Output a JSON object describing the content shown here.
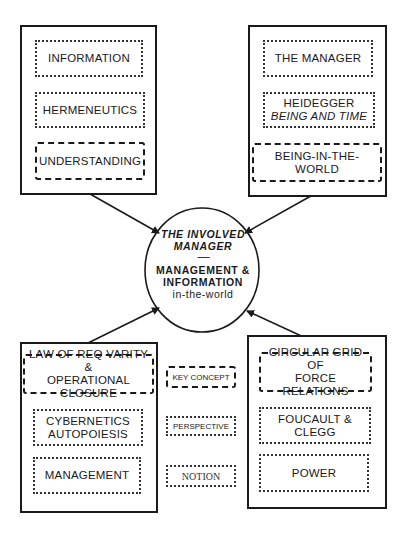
{
  "center": {
    "title_line1": "THE INVOLVED",
    "title_line2": "MANAGER",
    "separator": "-------",
    "line1": "MANAGEMENT &",
    "line2": "INFORMATION",
    "line3": "in-the-world"
  },
  "panels": {
    "top_left": {
      "notion": "INFORMATION",
      "perspective": "HERMENEUTICS",
      "key_concept": "UNDERSTANDING"
    },
    "top_right": {
      "notion": "THE MANAGER",
      "perspective_line1": "HEIDEGGER",
      "perspective_line2": "BEING AND TIME",
      "key_concept": "BEING-IN-THE-WORLD"
    },
    "bottom_left": {
      "key_concept_line1": "LAW OF REQ VARITY &",
      "key_concept_line2": "OPERATIONAL CLOSURE",
      "perspective_line1": "CYBERNETICS",
      "perspective_line2": "AUTOPOIESIS",
      "notion": "MANAGEMENT"
    },
    "bottom_right": {
      "key_concept_line1": "CIRCULAR GRID OF",
      "key_concept_line2": "FORCE RELATIONS",
      "perspective_line1": "FOUCAULT &",
      "perspective_line2": "CLEGG",
      "notion": "POWER"
    }
  },
  "legend": {
    "key_concept": "KEY CONCEPT",
    "perspective": "PERSPECTIVE",
    "notion": "NOTION"
  },
  "colors": {
    "stroke": "#1a1a1a",
    "background": "#ffffff"
  }
}
